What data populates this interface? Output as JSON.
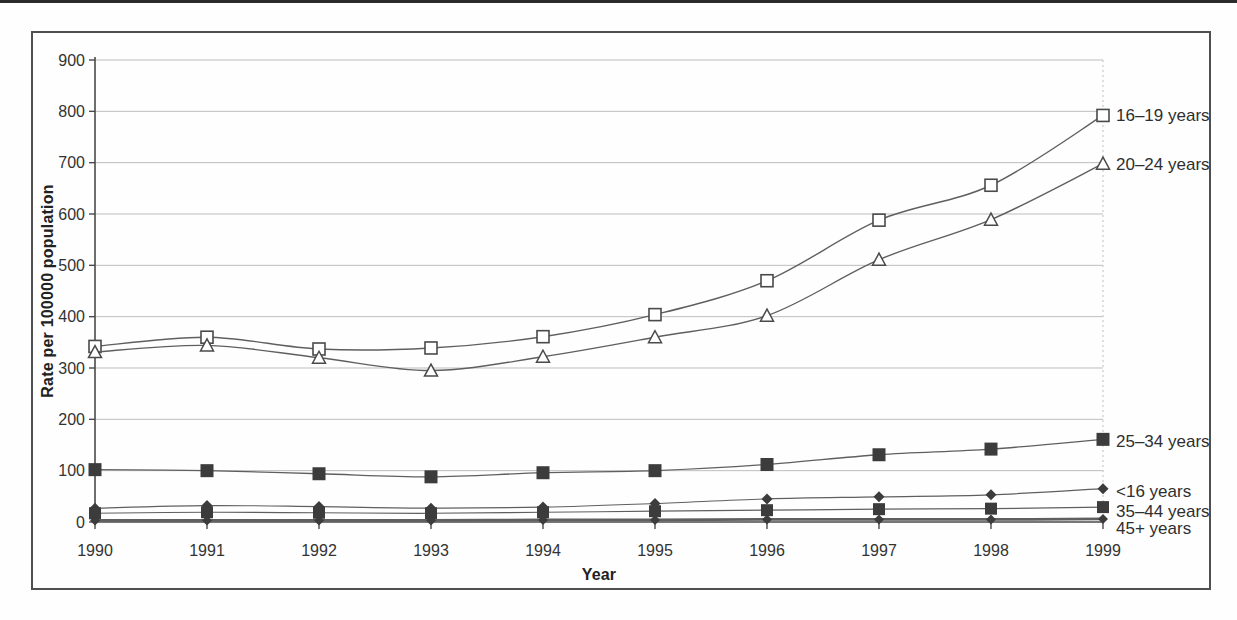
{
  "page": {
    "background_color": "#fefefe",
    "top_rule_color": "#2c2c2c",
    "frame_border_color": "#4f4f4f"
  },
  "chart_data": {
    "type": "line",
    "title": "",
    "xlabel": "Year",
    "ylabel": "Rate per 100000 population",
    "x": [
      1990,
      1991,
      1992,
      1993,
      1994,
      1995,
      1996,
      1997,
      1998,
      1999
    ],
    "ylim": [
      0,
      900
    ],
    "y_ticks": [
      0,
      100,
      200,
      300,
      400,
      500,
      600,
      700,
      800,
      900
    ],
    "grid": "horizontal",
    "legend_position": "labels-at-line-ends-right",
    "colors": {
      "line": "#5f5f5f",
      "marker": "#3c3c3c",
      "grid": "#bdbdbd",
      "axis": "#4a4a4a",
      "text": "#333333",
      "label_text": "#2f2f2f",
      "right_edge_dotted": "#c8c8c8"
    },
    "series": [
      {
        "name": "16–19 years",
        "marker": "square-open",
        "values": [
          342,
          360,
          337,
          339,
          361,
          404,
          470,
          588,
          656,
          792
        ]
      },
      {
        "name": "20–24 years",
        "marker": "triangle-open",
        "values": [
          331,
          344,
          320,
          295,
          322,
          360,
          402,
          511,
          589,
          698
        ]
      },
      {
        "name": "25–34 years",
        "marker": "square-filled",
        "values": [
          102,
          100,
          94,
          88,
          96,
          100,
          112,
          131,
          142,
          161
        ]
      },
      {
        "name": "<16 years",
        "marker": "diamond-filled",
        "values": [
          27,
          32,
          30,
          27,
          29,
          36,
          45,
          49,
          53,
          65
        ]
      },
      {
        "name": "35–44 years",
        "marker": "square-filled",
        "values": [
          17,
          19,
          18,
          17,
          19,
          21,
          23,
          25,
          26,
          29
        ]
      },
      {
        "name": "45+ years",
        "marker": "diamond-filled",
        "values": [
          3,
          3,
          3,
          3,
          4,
          4,
          5,
          5,
          5,
          6
        ]
      }
    ]
  }
}
